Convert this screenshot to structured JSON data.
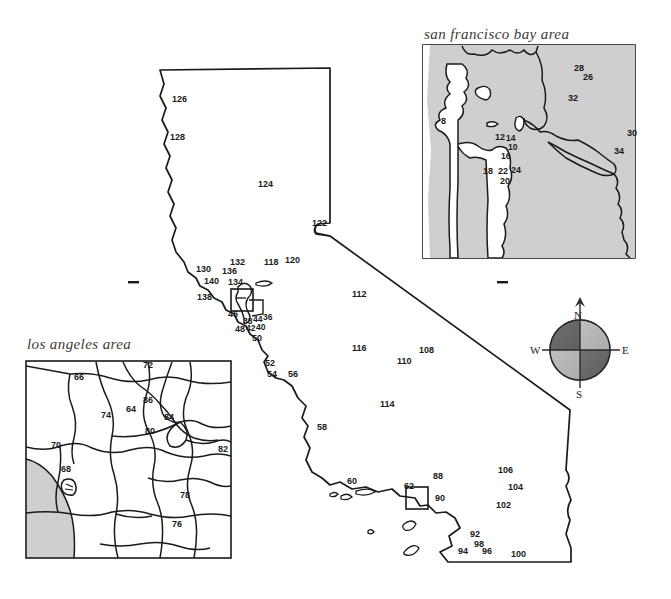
{
  "page": {
    "kind": "hand-drawn map figure",
    "width": 671,
    "height": 599,
    "background": "#ffffff",
    "ink": "#1a1a1a"
  },
  "insets": [
    {
      "id": "sf",
      "title": "san francisco bay area"
    },
    {
      "id": "la",
      "title": "los angeles area"
    }
  ],
  "compass": {
    "north": "N",
    "south": "S",
    "east": "E",
    "west": "W",
    "colors": {
      "dark": "#6b6b6b",
      "light": "#b5b5b5",
      "outline": "#2a2a2a"
    }
  },
  "colors": {
    "land_shade": "#cfcfcf",
    "ocean_shade": "#c9c9c9",
    "ink": "#1a1a1a",
    "title": "#3b3b3b",
    "white": "#ffffff"
  },
  "labels": {
    "main_map": [
      {
        "text": "126",
        "x": 172,
        "y": 102
      },
      {
        "text": "128",
        "x": 170,
        "y": 140
      },
      {
        "text": "124",
        "x": 258,
        "y": 187
      },
      {
        "text": "122",
        "x": 312,
        "y": 226
      },
      {
        "text": "132",
        "x": 230,
        "y": 265
      },
      {
        "text": "118",
        "x": 264,
        "y": 265
      },
      {
        "text": "120",
        "x": 285,
        "y": 263
      },
      {
        "text": "130",
        "x": 196,
        "y": 272
      },
      {
        "text": "136",
        "x": 222,
        "y": 274
      },
      {
        "text": "140",
        "x": 204,
        "y": 284
      },
      {
        "text": "134",
        "x": 228,
        "y": 285
      },
      {
        "text": "138",
        "x": 197,
        "y": 300
      },
      {
        "text": "46",
        "x": 228,
        "y": 317
      },
      {
        "text": "38",
        "x": 243,
        "y": 324
      },
      {
        "text": "44",
        "x": 253,
        "y": 322
      },
      {
        "text": "36",
        "x": 263,
        "y": 320
      },
      {
        "text": "42",
        "x": 246,
        "y": 331
      },
      {
        "text": "40",
        "x": 256,
        "y": 330
      },
      {
        "text": "48",
        "x": 235,
        "y": 332
      },
      {
        "text": "50",
        "x": 252,
        "y": 341
      },
      {
        "text": "52",
        "x": 265,
        "y": 366
      },
      {
        "text": "54",
        "x": 267,
        "y": 377
      },
      {
        "text": "56",
        "x": 288,
        "y": 377
      },
      {
        "text": "112",
        "x": 352,
        "y": 297
      },
      {
        "text": "116",
        "x": 352,
        "y": 351
      },
      {
        "text": "108",
        "x": 419,
        "y": 353
      },
      {
        "text": "110",
        "x": 397,
        "y": 364
      },
      {
        "text": "114",
        "x": 380,
        "y": 407
      },
      {
        "text": "58",
        "x": 317,
        "y": 430
      },
      {
        "text": "60",
        "x": 347,
        "y": 484
      },
      {
        "text": "62",
        "x": 404,
        "y": 489
      },
      {
        "text": "88",
        "x": 433,
        "y": 479
      },
      {
        "text": "90",
        "x": 435,
        "y": 501
      },
      {
        "text": "106",
        "x": 498,
        "y": 473
      },
      {
        "text": "104",
        "x": 508,
        "y": 490
      },
      {
        "text": "102",
        "x": 496,
        "y": 508
      },
      {
        "text": "92",
        "x": 470,
        "y": 537
      },
      {
        "text": "98",
        "x": 474,
        "y": 547
      },
      {
        "text": "94",
        "x": 458,
        "y": 554
      },
      {
        "text": "96",
        "x": 482,
        "y": 554
      },
      {
        "text": "100",
        "x": 511,
        "y": 557
      }
    ],
    "sf_inset": [
      {
        "text": "8",
        "x": 441,
        "y": 124
      },
      {
        "text": "12",
        "x": 495,
        "y": 140
      },
      {
        "text": "14",
        "x": 506,
        "y": 141
      },
      {
        "text": "10",
        "x": 508,
        "y": 150
      },
      {
        "text": "16",
        "x": 501,
        "y": 159
      },
      {
        "text": "18",
        "x": 483,
        "y": 174
      },
      {
        "text": "22",
        "x": 498,
        "y": 174
      },
      {
        "text": "24",
        "x": 511,
        "y": 173
      },
      {
        "text": "20",
        "x": 500,
        "y": 184
      },
      {
        "text": "28",
        "x": 574,
        "y": 71
      },
      {
        "text": "26",
        "x": 583,
        "y": 80
      },
      {
        "text": "32",
        "x": 568,
        "y": 101
      },
      {
        "text": "30",
        "x": 627,
        "y": 136
      },
      {
        "text": "34",
        "x": 614,
        "y": 154
      }
    ],
    "la_inset": [
      {
        "text": "72",
        "x": 143,
        "y": 368
      },
      {
        "text": "66",
        "x": 74,
        "y": 380
      },
      {
        "text": "86",
        "x": 143,
        "y": 403
      },
      {
        "text": "64",
        "x": 126,
        "y": 412
      },
      {
        "text": "74",
        "x": 101,
        "y": 418
      },
      {
        "text": "84",
        "x": 164,
        "y": 420
      },
      {
        "text": "80",
        "x": 145,
        "y": 434
      },
      {
        "text": "70",
        "x": 51,
        "y": 448
      },
      {
        "text": "82",
        "x": 218,
        "y": 452
      },
      {
        "text": "68",
        "x": 61,
        "y": 472
      },
      {
        "text": "78",
        "x": 180,
        "y": 498
      },
      {
        "text": "76",
        "x": 172,
        "y": 527
      }
    ]
  },
  "tick_marks": [
    {
      "x": 128,
      "y": 282,
      "w": 11
    },
    {
      "x": 497,
      "y": 282,
      "w": 11
    }
  ]
}
